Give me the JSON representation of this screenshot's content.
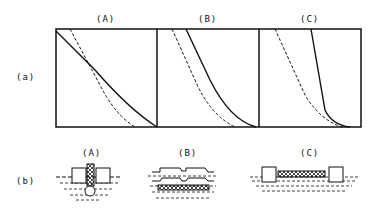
{
  "row_labels": {
    "a": "(a)",
    "b": "(b)"
  },
  "panels_a": [
    {
      "label": "(A)"
    },
    {
      "label": "(B)"
    },
    {
      "label": "(C)"
    }
  ],
  "panels_b": [
    {
      "label": "(A)"
    },
    {
      "label": "(B)"
    },
    {
      "label": "(C)"
    }
  ],
  "colors": {
    "line": "#111111",
    "background": "#ffffff"
  }
}
